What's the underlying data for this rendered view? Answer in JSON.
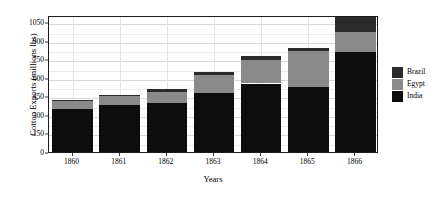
{
  "chart_data": {
    "type": "bar",
    "barmode": "stacked",
    "title": "",
    "xlabel": "Years",
    "ylabel": "Cotton Exports (millions lbs)",
    "categories": [
      "1860",
      "1861",
      "1862",
      "1863",
      "1864",
      "1865",
      "1866"
    ],
    "series": [
      {
        "name": "India",
        "color": "#0d0d0d",
        "values": [
          345,
          380,
          395,
          475,
          555,
          530,
          810
        ]
      },
      {
        "name": "Egypt",
        "color": "#8a8a8a",
        "values": [
          65,
          70,
          95,
          145,
          190,
          285,
          165
        ]
      },
      {
        "name": "Brazil",
        "color": "#2a2a2a",
        "values": [
          10,
          15,
          20,
          30,
          30,
          30,
          120
        ]
      }
    ],
    "totals": [
      420,
      465,
      510,
      650,
      775,
      845,
      1095
    ],
    "ylim": [
      0,
      1110
    ],
    "yticks": [
      0,
      150,
      300,
      450,
      600,
      750,
      900,
      1050
    ],
    "ytick_labels": [
      "0",
      "150",
      "300",
      "450",
      "600",
      "750",
      "900",
      "1050"
    ],
    "grid": true,
    "grid_color": "#d9d9d9",
    "panel_background": "#ffffff",
    "panel_border": "#1a1a1a",
    "legend": {
      "position": "right",
      "entries": [
        {
          "label": "Brazil",
          "color": "#2a2a2a"
        },
        {
          "label": "Egypt",
          "color": "#8a8a8a"
        },
        {
          "label": "India",
          "color": "#0d0d0d"
        }
      ]
    }
  }
}
